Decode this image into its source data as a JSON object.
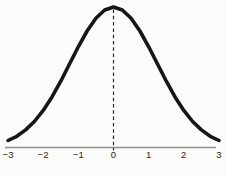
{
  "colors": {
    "background": "#fbfbf9",
    "curve": "#161616",
    "axis_line": "#8f8f8f",
    "dashed_line": "#2c2c2c",
    "tick_label": "#262626"
  },
  "chart_data": {
    "type": "line",
    "title": "",
    "xlabel": "",
    "ylabel": "",
    "xlim": [
      -3,
      3
    ],
    "ylim": [
      0,
      1
    ],
    "grid": false,
    "legend": false,
    "x_ticks": [
      -3,
      -2,
      -1,
      0,
      1,
      2,
      3
    ],
    "x_tick_labels": [
      "−3",
      "−2",
      "−1",
      "0",
      "1",
      "2",
      "3"
    ],
    "series": [
      {
        "name": "normal-density-curve",
        "x": [
          -3,
          -2.75,
          -2.5,
          -2.25,
          -2,
          -1.75,
          -1.5,
          -1.25,
          -1,
          -0.75,
          -0.5,
          -0.25,
          0,
          0.25,
          0.5,
          0.75,
          1,
          1.25,
          1.5,
          1.75,
          2,
          2.25,
          2.5,
          2.75,
          3
        ],
        "y": [
          0.05,
          0.08,
          0.125,
          0.185,
          0.264,
          0.36,
          0.472,
          0.594,
          0.717,
          0.829,
          0.92,
          0.979,
          1.0,
          0.979,
          0.92,
          0.829,
          0.717,
          0.594,
          0.472,
          0.36,
          0.264,
          0.185,
          0.125,
          0.08,
          0.05
        ]
      }
    ],
    "annotations": [
      {
        "type": "vline",
        "x": 0,
        "style": "dashed"
      }
    ]
  }
}
